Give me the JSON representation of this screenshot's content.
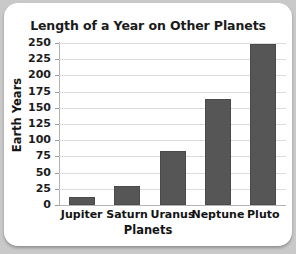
{
  "chart_data": {
    "type": "bar",
    "title": "Length of a Year on Other Planets",
    "xlabel": "Planets",
    "ylabel": "Earth Years",
    "categories": [
      "Jupiter",
      "Saturn",
      "Uranus",
      "Neptune",
      "Pluto"
    ],
    "values": [
      12,
      29,
      84,
      164,
      248
    ],
    "ylim": [
      0,
      250
    ],
    "ytick_labels": [
      "250",
      "225",
      "200",
      "175",
      "150",
      "125",
      "100",
      "75",
      "50",
      "25",
      "0"
    ],
    "ytick_values": [
      250,
      225,
      200,
      175,
      150,
      125,
      100,
      75,
      50,
      25,
      0
    ],
    "grid": true,
    "legend": "none",
    "bar_color": "#565656",
    "grid_color": "#dcdcdc",
    "background_color": "#ffffff",
    "page_background_color": "#c9c9c9"
  }
}
